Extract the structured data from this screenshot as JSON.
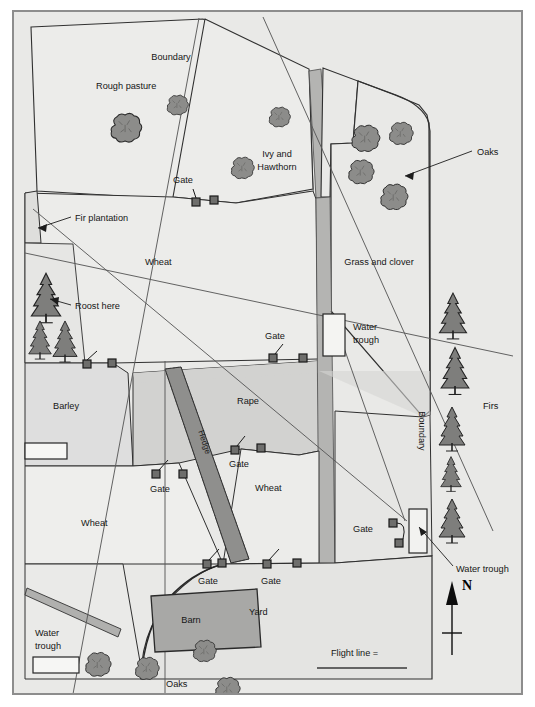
{
  "map": {
    "title": "Farm field survey map",
    "frame": {
      "border_color": "#8d8d8d",
      "background": "#e8e8e6"
    },
    "colors": {
      "paper": "#ffffff",
      "field_light": "#eeeeec",
      "field_pale": "#e6e6e4",
      "field_mid": "#d9d9d7",
      "field_dark": "#cfcfcd",
      "hedge": "#9b9b99",
      "track": "#b3b3b1",
      "barn": "#a9a9a7",
      "tree_fill": "#8a8a88",
      "ink": "#1a1a1a",
      "line": "#444444"
    },
    "fields": [
      {
        "id": "rough-pasture",
        "label": "Rough pasture",
        "x": 93,
        "y": 86
      },
      {
        "id": "ivy-hawthorn-1",
        "label": "Ivy and",
        "x": 275,
        "y": 150
      },
      {
        "id": "ivy-hawthorn-2",
        "label": "Hawthorn",
        "x": 275,
        "y": 163
      },
      {
        "id": "grass-clover",
        "label": "Grass and clover",
        "x": 378,
        "y": 262
      },
      {
        "id": "wheat-north",
        "label": "Wheat",
        "x": 143,
        "y": 262
      },
      {
        "id": "barley",
        "label": "Barley",
        "x": 60,
        "y": 405
      },
      {
        "id": "rape",
        "label": "Rape",
        "x": 240,
        "y": 400
      },
      {
        "id": "wheat-mid",
        "label": "Wheat",
        "x": 262,
        "y": 487
      },
      {
        "id": "wheat-south",
        "label": "Wheat",
        "x": 83,
        "y": 522
      },
      {
        "id": "yard",
        "label": "Yard",
        "x": 250,
        "y": 610
      },
      {
        "id": "barn",
        "label": "Barn",
        "x": 175,
        "y": 614
      },
      {
        "id": "hedge",
        "label": "Hedge",
        "x": 189,
        "y": 432
      },
      {
        "id": "firs",
        "label": "Firs",
        "x": 483,
        "y": 405
      }
    ],
    "boundary_labels": [
      {
        "id": "boundary-north",
        "label": "Boundary",
        "x": 170,
        "y": 58,
        "rotation": 0
      },
      {
        "id": "boundary-east",
        "label": "Boundary",
        "x": 418,
        "y": 428,
        "rotation": -90
      }
    ],
    "annotations": [
      {
        "id": "oaks-callout",
        "label": "Oaks",
        "x": 478,
        "y": 143
      },
      {
        "id": "oaks-bottom",
        "label": "Oaks",
        "x": 178,
        "y": 680
      },
      {
        "id": "fir-plantation",
        "label": "Fir plantation",
        "x": 62,
        "y": 208
      },
      {
        "id": "roost-here",
        "label": "Roost here",
        "x": 62,
        "y": 297
      },
      {
        "id": "water-trough-north-1",
        "label": "Water",
        "x": 340,
        "y": 322
      },
      {
        "id": "water-trough-north-2",
        "label": "trough",
        "x": 340,
        "y": 335
      },
      {
        "id": "water-trough-east",
        "label": "Water trough",
        "x": 457,
        "y": 561
      },
      {
        "id": "water-trough-west-1",
        "label": "Water",
        "x": 40,
        "y": 630
      },
      {
        "id": "water-trough-west-2",
        "label": "trough",
        "x": 40,
        "y": 643
      }
    ],
    "gates": [
      {
        "id": "gate-rough-pasture",
        "label": "Gate",
        "label_x": 172,
        "label_y": 172,
        "a_x": 183,
        "a_y": 191,
        "b_x": 201,
        "b_y": 189,
        "leader_x": 181,
        "leader_y": 178
      },
      {
        "id": "gate-wheat-north",
        "label": "Gate",
        "label_x": 264,
        "label_y": 327,
        "a_x": 260,
        "a_y": 347,
        "b_x": 290,
        "b_y": 347,
        "leader_x": 268,
        "leader_y": 334
      },
      {
        "id": "gate-rape-east",
        "label": "Gate",
        "label_x": 231,
        "label_y": 455,
        "a_x": 222,
        "a_y": 440,
        "b_x": 248,
        "b_y": 438,
        "leader_x": 230,
        "leader_y": 428
      },
      {
        "id": "gate-barley",
        "label": "Gate",
        "label_x": 147,
        "label_y": 477,
        "a_x": 143,
        "a_y": 464,
        "b_x": 170,
        "b_y": 464,
        "leader_x": 154,
        "leader_y": 452
      },
      {
        "id": "gate-hedge-west",
        "label": "Gate",
        "label_x": 197,
        "label_y": 573,
        "a_x": 194,
        "a_y": 554,
        "b_x": 208,
        "b_y": 553,
        "leader_x": 206,
        "leader_y": 541
      },
      {
        "id": "gate-hedge-east",
        "label": "Gate",
        "label_x": 262,
        "label_y": 573,
        "a_x": 254,
        "a_y": 554,
        "b_x": 284,
        "b_y": 553,
        "leader_x": 268,
        "leader_y": 541
      },
      {
        "id": "gate-southeast",
        "label": "Gate",
        "label_x": 355,
        "label_y": 523,
        "a_x": 380,
        "a_y": 513,
        "b_x": 386,
        "b_y": 531,
        "leader_x": 394,
        "leader_y": 518
      },
      {
        "id": "gate-fir-plantation",
        "label": "",
        "label_x": 0,
        "label_y": 0,
        "a_x": 74,
        "a_y": 355,
        "b_x": 99,
        "b_y": 354,
        "leader_x": 84,
        "leader_y": 342
      }
    ],
    "legend": {
      "flight_line_label": "Flight line =",
      "compass_label": "N"
    },
    "icons": {
      "oak": "oak-tree-icon",
      "fir": "fir-tree-icon",
      "compass": "compass-north-icon",
      "gate": "gate-icon",
      "trough": "water-trough-icon"
    }
  }
}
